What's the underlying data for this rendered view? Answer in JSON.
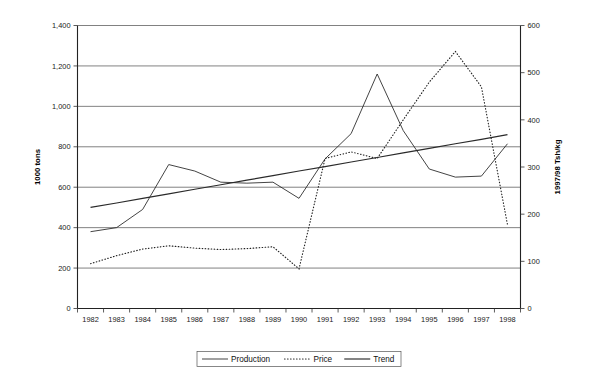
{
  "chart_data": {
    "type": "line",
    "title": "",
    "subtitle": "",
    "xlabel": "",
    "ylabel": "1000 tons",
    "y2label": "1997/98 Tsh/kg",
    "grid": true,
    "legend_position": "bottom",
    "x": [
      "1982",
      "1983",
      "1984",
      "1985",
      "1986",
      "1987",
      "1988",
      "1989",
      "1990",
      "1991",
      "1992",
      "1993",
      "1994",
      "1995",
      "1996",
      "1997",
      "1998"
    ],
    "ylim": [
      0,
      1400
    ],
    "yticks": [
      "0",
      "200",
      "400",
      "600",
      "800",
      "1,000",
      "1,200",
      "1,400"
    ],
    "ytick_values": [
      0,
      200,
      400,
      600,
      800,
      1000,
      1200,
      1400
    ],
    "y2lim": [
      0,
      600
    ],
    "y2ticks": [
      "0",
      "100",
      "200",
      "300",
      "400",
      "500",
      "600"
    ],
    "y2tick_values": [
      0,
      100,
      200,
      300,
      400,
      500,
      600
    ],
    "series": [
      {
        "name": "Production",
        "axis": "left",
        "style": "solid-thin",
        "values": [
          380,
          400,
          490,
          712,
          680,
          625,
          620,
          625,
          545,
          740,
          865,
          1160,
          880,
          690,
          650,
          655,
          815
        ]
      },
      {
        "name": "Price",
        "axis": "right",
        "style": "dotted",
        "values": [
          95,
          112,
          126,
          133,
          128,
          125,
          127,
          131,
          84,
          318,
          332,
          318,
          400,
          480,
          545,
          470,
          178
        ]
      },
      {
        "name": "Trend",
        "axis": "left",
        "style": "solid-thick",
        "values": [
          500,
          522,
          545,
          567,
          590,
          612,
          635,
          657,
          680,
          702,
          725,
          747,
          770,
          792,
          815,
          837,
          860
        ]
      }
    ]
  },
  "legend": {
    "items": [
      {
        "label": "Production",
        "style": "solid-thin"
      },
      {
        "label": "Price",
        "style": "dotted"
      },
      {
        "label": "Trend",
        "style": "solid-thick"
      }
    ]
  }
}
